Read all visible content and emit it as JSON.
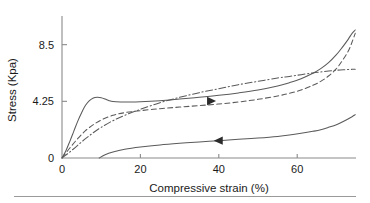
{
  "chart_data": {
    "type": "line",
    "title": "",
    "xlabel": "Compressive strain (%)",
    "ylabel": "Stress (Kpa)",
    "xlim": [
      0,
      75
    ],
    "ylim": [
      0,
      10.2
    ],
    "xticks": [
      0,
      20,
      40,
      60
    ],
    "xtick_labels": [
      "0",
      "20",
      "40",
      "60"
    ],
    "yticks": [
      0,
      4.25,
      8.5
    ],
    "ytick_labels": [
      "0",
      "4.25",
      "8.5"
    ],
    "grid": false,
    "legend": "none",
    "series": [
      {
        "name": "loading-solid",
        "style": "solid",
        "color": "#5a5a5a",
        "x": [
          0,
          1,
          2,
          3,
          4,
          5,
          6,
          7,
          8,
          9,
          10,
          11,
          12,
          13,
          15,
          17,
          20,
          25,
          30,
          35,
          40,
          45,
          50,
          55,
          58,
          61,
          64,
          66,
          68,
          70,
          71.5,
          73,
          74,
          74.8
        ],
        "y": [
          0,
          0.55,
          1.25,
          2.0,
          2.75,
          3.4,
          3.95,
          4.3,
          4.5,
          4.55,
          4.52,
          4.42,
          4.3,
          4.23,
          4.2,
          4.2,
          4.22,
          4.3,
          4.42,
          4.55,
          4.7,
          4.88,
          5.1,
          5.4,
          5.65,
          5.95,
          6.35,
          6.7,
          7.15,
          7.75,
          8.3,
          8.9,
          9.35,
          9.6
        ]
      },
      {
        "name": "dashed-curve",
        "style": "dashed",
        "color": "#5a5a5a",
        "x": [
          0,
          2,
          4,
          6,
          8,
          10,
          13,
          16,
          20,
          25,
          30,
          35,
          40,
          45,
          50,
          55,
          58,
          61,
          64,
          66,
          68,
          70,
          71.5,
          73,
          74,
          74.8
        ],
        "y": [
          0,
          0.75,
          1.45,
          2.05,
          2.5,
          2.85,
          3.2,
          3.4,
          3.55,
          3.7,
          3.82,
          3.93,
          4.05,
          4.2,
          4.4,
          4.65,
          4.85,
          5.1,
          5.45,
          5.75,
          6.15,
          6.7,
          7.3,
          8.0,
          8.7,
          9.35
        ]
      },
      {
        "name": "dash-dot-curve",
        "style": "dashdot",
        "color": "#5a5a5a",
        "x": [
          0,
          2,
          4,
          6,
          8,
          10,
          13,
          16,
          20,
          25,
          30,
          35,
          40,
          45,
          50,
          55,
          58,
          61,
          64,
          66,
          68,
          70,
          72,
          74,
          74.8
        ],
        "y": [
          0,
          0.45,
          0.95,
          1.45,
          1.9,
          2.3,
          2.8,
          3.2,
          3.65,
          4.15,
          4.55,
          4.9,
          5.2,
          5.5,
          5.75,
          6.0,
          6.12,
          6.25,
          6.38,
          6.45,
          6.52,
          6.58,
          6.62,
          6.65,
          6.66
        ]
      },
      {
        "name": "unloading-curve",
        "style": "solid",
        "color": "#5a5a5a",
        "x": [
          9.5,
          11,
          13,
          16,
          20,
          25,
          30,
          35,
          40,
          45,
          50,
          55,
          58,
          61,
          64,
          66,
          68,
          70,
          72,
          74,
          74.8
        ],
        "y": [
          0,
          0.25,
          0.45,
          0.65,
          0.82,
          0.98,
          1.1,
          1.2,
          1.3,
          1.4,
          1.5,
          1.62,
          1.72,
          1.85,
          2.0,
          2.12,
          2.3,
          2.5,
          2.78,
          3.1,
          3.25
        ]
      }
    ],
    "annotations": [
      {
        "name": "loading-direction-arrow",
        "symbol": "arrow-right-icon",
        "direction": "right",
        "x": 37,
        "y": 4.27
      },
      {
        "name": "unloading-direction-arrow",
        "symbol": "arrow-left-icon",
        "direction": "left",
        "x": 41,
        "y": 1.3
      }
    ]
  }
}
